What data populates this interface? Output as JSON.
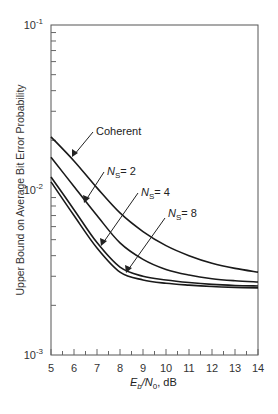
{
  "chart_data": {
    "type": "line",
    "title": "",
    "xlabel": "E_b/N_0, dB",
    "ylabel": "Upper Bound on Average Bit Error Probability",
    "xlim": [
      5,
      14
    ],
    "ylim": [
      0.001,
      0.1
    ],
    "yscale": "log",
    "grid": false,
    "x_ticks": [
      5,
      6,
      7,
      8,
      9,
      10,
      11,
      12,
      13,
      14
    ],
    "y_ticks": [
      {
        "value": 0.1,
        "base": "10",
        "exp": "-1"
      },
      {
        "value": 0.01,
        "base": "10",
        "exp": "-2"
      },
      {
        "value": 0.001,
        "base": "10",
        "exp": "-3"
      }
    ],
    "x": [
      5,
      6,
      7,
      8,
      9,
      10,
      11,
      12,
      13,
      14
    ],
    "series": [
      {
        "name": "Coherent",
        "values": [
          0.021,
          0.015,
          0.0103,
          0.00726,
          0.0056,
          0.0046,
          0.004,
          0.0036,
          0.00335,
          0.00318
        ]
      },
      {
        "name": "N_S = 2",
        "values": [
          0.0158,
          0.0105,
          0.007,
          0.00478,
          0.0038,
          0.0033,
          0.00305,
          0.0029,
          0.00282,
          0.00277
        ]
      },
      {
        "name": "N_S = 4",
        "values": [
          0.012,
          0.0076,
          0.0048,
          0.00341,
          0.003,
          0.00285,
          0.00275,
          0.00268,
          0.00264,
          0.00262
        ]
      },
      {
        "name": "N_S = 8",
        "values": [
          0.0112,
          0.007,
          0.00445,
          0.00318,
          0.00285,
          0.00272,
          0.00265,
          0.0026,
          0.00257,
          0.00255
        ]
      }
    ],
    "annotations": [
      {
        "text": "Coherent",
        "points_to": "Coherent"
      },
      {
        "text": "N_S = 2",
        "points_to": "N_S = 2"
      },
      {
        "text": "N_S = 4",
        "points_to": "N_S = 4"
      },
      {
        "text": "N_S = 8",
        "points_to": "N_S = 8"
      }
    ]
  },
  "labels": {
    "ylabel": "Upper Bound on Average Bit Error Probability",
    "xlabel_E": "E",
    "xlabel_b": "b",
    "xlabel_N": "/N",
    "xlabel_0": "0",
    "xlabel_unit": ", dB",
    "ann_coherent": "Coherent",
    "ann_N": "N",
    "ann_S": "S",
    "ann_ns2": "= 2",
    "ann_ns4": "= 4",
    "ann_ns8": "= 8"
  }
}
